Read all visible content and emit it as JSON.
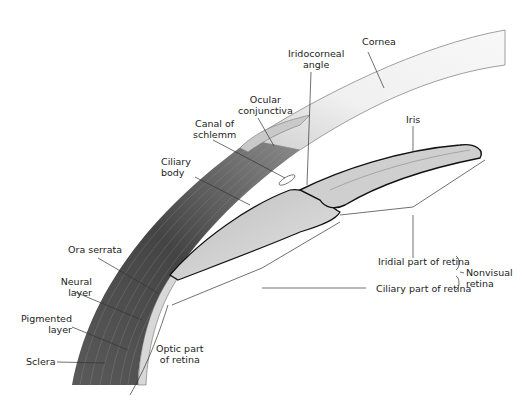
{
  "diagram": {
    "title": "",
    "labels": {
      "cornea": "Cornea",
      "iridocorneal_angle": [
        "Iridocorneal",
        "angle"
      ],
      "ocular_conjunctiva": [
        "Ocular",
        "conjunctiva"
      ],
      "canal_of_schlemm": [
        "Canal of",
        "schlemm"
      ],
      "iris": "Iris",
      "ciliary_body": [
        "Ciliary",
        "body"
      ],
      "ora_serrata": "Ora serrata",
      "neural_layer": [
        "Neural",
        "layer"
      ],
      "pigmented_layer": [
        "Pigmented",
        "layer"
      ],
      "sclera": "Sclera",
      "optic_part_of_retina": [
        "Optic part",
        "of retina"
      ],
      "iridial_part_of_retina": "Iridial part of retina",
      "ciliary_part_of_retina": "Ciliary part of retina",
      "nonvisual_retina": [
        "Nonvisual",
        "retina"
      ]
    },
    "colors": {
      "sclera_dark": "#4a4a4a",
      "sclera_mid": "#7a7a7a",
      "cornea_fill": "#f2f2f2",
      "leader_line": "#333333",
      "pigment_edge": "#111111"
    }
  }
}
